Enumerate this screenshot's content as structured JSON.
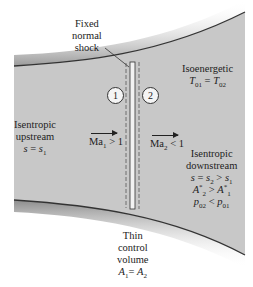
{
  "diagram": {
    "shock_label": [
      "Fixed",
      "normal",
      "shock"
    ],
    "station_1": "1",
    "station_2": "2",
    "upstream": {
      "line1": "Isentropic",
      "line2": "upstream",
      "line3": "s = s1"
    },
    "upstream_mach": "Ma1 > 1",
    "downstream_mach": "Ma2 < 1",
    "isoenergetic": {
      "line1": "Isoenergetic",
      "line2": "T01 = T02"
    },
    "downstream": {
      "line1": "Isentropic",
      "line2": "downstream",
      "line3": "s = s2 > s1",
      "line4": "A2* > A1*",
      "line5": "p02 < p01"
    },
    "control_volume": {
      "line1": "Thin",
      "line2": "control",
      "line3": "volume",
      "line4": "A1 = A2"
    },
    "colors": {
      "duct_fill": "#c8c8c8",
      "wall": "#333333",
      "background": "#ffffff"
    }
  }
}
